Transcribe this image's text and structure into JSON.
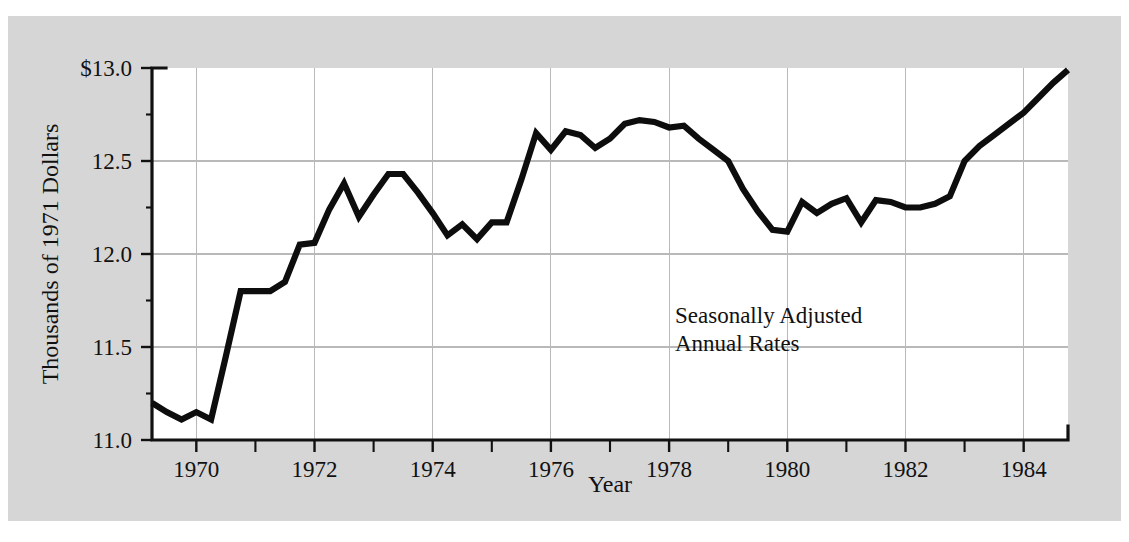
{
  "figure": {
    "background_color": "#ffffff",
    "panel_color": "#d6d6d6",
    "plot_background_color": "#ffffff",
    "line_color": "#0d0d0d",
    "grid_color": "#b9b9b9",
    "axis_color": "#111111",
    "cropped_title": ""
  },
  "chart_data": {
    "type": "line",
    "title": "",
    "subtitle": "",
    "xlabel": "Year",
    "ylabel": "Thousands of 1971 Dollars",
    "xlim": [
      1969.25,
      1984.75
    ],
    "ylim": [
      11.0,
      13.0
    ],
    "grid": true,
    "legend": null,
    "annotations": [
      {
        "text_lines": [
          "Seasonally Adjusted",
          "Annual Rates"
        ],
        "x": 1978.1,
        "y": 11.63
      }
    ],
    "y_ticks": [
      11.0,
      11.5,
      12.0,
      12.5,
      13.0
    ],
    "y_tick_labels": [
      "11.0",
      "11.5",
      "12.0",
      "12.5",
      "$13.0"
    ],
    "y_minor_ticks": [
      11.25,
      11.75,
      12.25,
      12.75
    ],
    "x_ticks": [
      1970,
      1972,
      1974,
      1976,
      1978,
      1980,
      1982,
      1984
    ],
    "x_tick_labels": [
      "1970",
      "1972",
      "1974",
      "1976",
      "1978",
      "1980",
      "1982",
      "1984"
    ],
    "x_minor_ticks": [
      1971,
      1973,
      1975,
      1977,
      1979,
      1981,
      1983
    ],
    "series": [
      {
        "name": "Real Disposable Income per Capita",
        "x": [
          1969.25,
          1969.5,
          1969.75,
          1970.0,
          1970.25,
          1970.5,
          1970.75,
          1971.0,
          1971.25,
          1971.5,
          1971.75,
          1972.0,
          1972.25,
          1972.5,
          1972.75,
          1973.0,
          1973.25,
          1973.5,
          1973.75,
          1974.0,
          1974.25,
          1974.5,
          1974.75,
          1975.0,
          1975.25,
          1975.5,
          1975.75,
          1976.0,
          1976.25,
          1976.5,
          1976.75,
          1977.0,
          1977.25,
          1977.5,
          1977.75,
          1978.0,
          1978.25,
          1978.5,
          1978.75,
          1979.0,
          1979.25,
          1979.5,
          1979.75,
          1980.0,
          1980.25,
          1980.5,
          1980.75,
          1981.0,
          1981.25,
          1981.5,
          1981.75,
          1982.0,
          1982.25,
          1982.5,
          1982.75,
          1983.0,
          1983.25,
          1983.5,
          1983.75,
          1984.0,
          1984.25,
          1984.5,
          1984.75
        ],
        "y": [
          11.2,
          11.15,
          11.11,
          11.15,
          11.11,
          11.45,
          11.8,
          11.8,
          11.8,
          11.85,
          12.05,
          12.06,
          12.24,
          12.38,
          12.2,
          12.32,
          12.43,
          12.43,
          12.33,
          12.22,
          12.1,
          12.16,
          12.08,
          12.17,
          12.17,
          12.4,
          12.65,
          12.56,
          12.66,
          12.64,
          12.57,
          12.62,
          12.7,
          12.72,
          12.71,
          12.68,
          12.69,
          12.62,
          12.56,
          12.5,
          12.35,
          12.23,
          12.13,
          12.12,
          12.28,
          12.22,
          12.27,
          12.3,
          12.17,
          12.29,
          12.28,
          12.25,
          12.25,
          12.27,
          12.31,
          12.5,
          12.58,
          12.64,
          12.7,
          12.76,
          12.84,
          12.92,
          12.99
        ]
      }
    ]
  },
  "axis": {
    "y_title": "Thousands of 1971 Dollars",
    "x_title": "Year"
  },
  "annotation": {
    "line1": "Seasonally Adjusted",
    "line2": "Annual Rates"
  }
}
